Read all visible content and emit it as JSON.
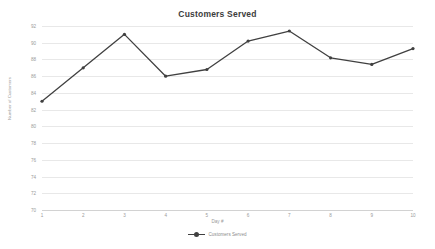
{
  "chart_data": {
    "type": "line",
    "title": "Customers Served",
    "xlabel": "Day #",
    "ylabel": "Number of Customers",
    "categories": [
      1,
      2,
      3,
      4,
      5,
      6,
      7,
      8,
      9,
      10
    ],
    "x_tick_labels": [
      "1",
      "2",
      "3",
      "4",
      "5",
      "6",
      "7",
      "8",
      "9",
      "10"
    ],
    "y_tick_labels": [
      "92",
      "90",
      "88",
      "86",
      "84",
      "82",
      "80",
      "78",
      "76",
      "74",
      "72",
      "70"
    ],
    "y_ticks": [
      92,
      90,
      88,
      86,
      84,
      82,
      80,
      78,
      76,
      74,
      72,
      70
    ],
    "ylim": [
      70,
      92
    ],
    "xlim": [
      1,
      10
    ],
    "grid": true,
    "legend_position": "bottom",
    "series": [
      {
        "name": "Customers Served",
        "color": "#404040",
        "marker": "circle",
        "values": [
          83,
          87,
          91,
          86,
          86.8,
          90.2,
          91.4,
          88.2,
          87.4,
          89.3
        ]
      }
    ]
  },
  "legend": {
    "entries": [
      {
        "label": "Customers Served"
      }
    ]
  },
  "colors": {
    "line": "#404040",
    "grid": "#e8e8e8",
    "axis": "#d2d2d2",
    "title_text": "#3c3c3c",
    "tick_text": "#9a9a9a",
    "background": "#ffffff"
  }
}
